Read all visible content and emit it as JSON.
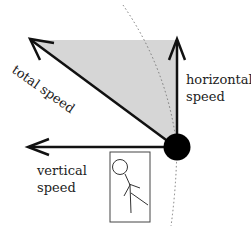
{
  "diagram": {
    "labels": {
      "total_speed": "total speed",
      "horizontal_speed_line1": "horizontal",
      "horizontal_speed_line2": "speed",
      "vertical_speed_line1": "vertical",
      "vertical_speed_line2": "speed"
    },
    "colors": {
      "arrow": "#111111",
      "triangle_fill": "#d6d6d6",
      "ball": "#000000",
      "dotted_arc": "#777777",
      "box_border": "#444444"
    }
  }
}
